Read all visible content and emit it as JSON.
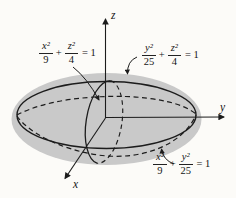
{
  "figure": {
    "background": "#fcfbf8",
    "surface_fill": "#c9c9c9",
    "line_color": "#1c1c1c"
  },
  "axes": {
    "x_label": "x",
    "y_label": "y",
    "z_label": "z"
  },
  "equations": {
    "xz_trace": {
      "n1": "x²",
      "d1": "9",
      "op": "+",
      "n2": "z²",
      "d2": "4",
      "rhs": "= 1"
    },
    "yz_trace": {
      "n1": "y²",
      "d1": "25",
      "op": "+",
      "n2": "z²",
      "d2": "4",
      "rhs": "= 1"
    },
    "xy_trace": {
      "n1": "x²",
      "d1": "9",
      "op": "+",
      "n2": "y²",
      "d2": "25",
      "rhs": "= 1"
    }
  }
}
